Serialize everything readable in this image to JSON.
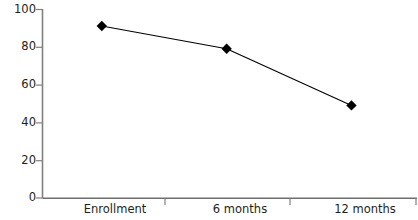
{
  "chart_data": {
    "type": "line",
    "title": "",
    "xlabel": "",
    "ylabel": "",
    "categories": [
      "Enrollment",
      "6 months",
      "12 months"
    ],
    "values": [
      91,
      79,
      49
    ],
    "series": [
      {
        "name": "",
        "values": [
          91,
          79,
          49
        ]
      }
    ],
    "ylim": [
      0,
      100
    ],
    "yticks": [
      0,
      20,
      40,
      60,
      80,
      100
    ],
    "ytick_labels": [
      "0",
      "20",
      "40",
      "60",
      "80",
      "100"
    ],
    "grid": false,
    "legend": false,
    "marker": "diamond",
    "colors": {
      "line": "#000000",
      "marker": "#000000",
      "axis": "#808080",
      "text": "#231f20",
      "background": "#ffffff"
    }
  },
  "axes": {
    "y": {
      "ticks": [
        {
          "label": "100",
          "value": 100
        },
        {
          "label": "80",
          "value": 80
        },
        {
          "label": "60",
          "value": 60
        },
        {
          "label": "40",
          "value": 40
        },
        {
          "label": "20",
          "value": 20
        },
        {
          "label": "0",
          "value": 0
        }
      ]
    },
    "x": {
      "ticks": [
        {
          "label": "Enrollment"
        },
        {
          "label": "6 months"
        },
        {
          "label": "12 months"
        }
      ]
    }
  }
}
